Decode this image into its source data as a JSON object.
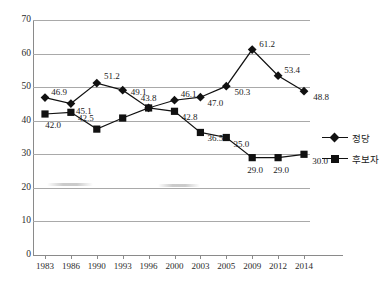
{
  "chart_data": {
    "type": "line",
    "title": "",
    "subtitle": "",
    "xlabel": "",
    "ylabel": "",
    "ylim": [
      0,
      70
    ],
    "ytick_step": 10,
    "yticks": [
      0,
      10,
      20,
      30,
      40,
      50,
      60,
      70
    ],
    "grid": "horizontal",
    "legend_position": "right",
    "categories": [
      "1983",
      "1986",
      "1990",
      "1993",
      "1996",
      "2000",
      "2003",
      "2005",
      "2009",
      "2012",
      "2014"
    ],
    "series": [
      {
        "name": "정당",
        "marker": "diamond",
        "values": [
          46.9,
          45.1,
          51.2,
          49.1,
          43.8,
          46.1,
          47.0,
          50.3,
          61.2,
          53.4,
          48.8
        ],
        "labels": [
          "46.9",
          "45.1",
          "51.2",
          "49.1",
          "43.8",
          "46.1",
          "47.0",
          "50.3",
          "61.2",
          "53.4",
          "48.8"
        ]
      },
      {
        "name": "후보자",
        "marker": "square",
        "values": [
          42.0,
          42.5,
          37.5,
          40.8,
          43.8,
          42.8,
          36.5,
          35.0,
          29.0,
          29.0,
          30.0
        ],
        "labels": [
          "42.0",
          "42.5",
          "",
          "",
          "",
          "42.8",
          "36.5",
          "35.0",
          "29.0",
          "29.0",
          "30.0"
        ]
      }
    ]
  },
  "legend": {
    "entries": [
      {
        "label": "정당",
        "marker": "diamond"
      },
      {
        "label": "후보자",
        "marker": "square"
      }
    ]
  },
  "axis": {
    "x_tick_labels": [
      "1983",
      "1986",
      "1990",
      "1993",
      "1996",
      "2000",
      "2003",
      "2005",
      "2009",
      "2012",
      "2014"
    ],
    "y_tick_labels": [
      "0",
      "10",
      "20",
      "30",
      "40",
      "50",
      "60",
      "70"
    ]
  }
}
